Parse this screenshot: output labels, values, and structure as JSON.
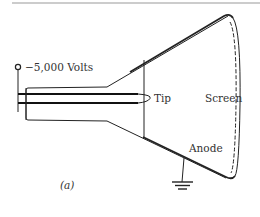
{
  "diagram": {
    "labels": {
      "voltage": "−5,000 Volts",
      "tip": "Tip",
      "screen": "Screen",
      "anode": "Anode",
      "caption": "(a)"
    },
    "colors": {
      "ink": "#222222",
      "rule": "#999999"
    }
  }
}
